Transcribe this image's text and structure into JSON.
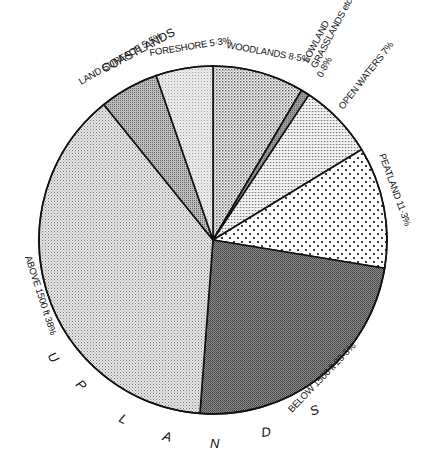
{
  "chart_data": {
    "type": "pie",
    "title": "",
    "start_angle_deg": 0,
    "direction": "clockwise",
    "slices": [
      {
        "label": "WOODLANDS",
        "value": 8.5,
        "display": "WOODLANDS 8·5%",
        "pattern": "crosshatch-medium"
      },
      {
        "label": "LOWLAND GRASSLANDS etc",
        "value": 0.8,
        "display": "0·8%",
        "pattern": "dark-grey"
      },
      {
        "label": "OPEN WATERS",
        "value": 7,
        "display": "OPEN WATERS 7%",
        "pattern": "fine-grid"
      },
      {
        "label": "PEATLAND",
        "value": 11.3,
        "display": "PEATLAND 11·3%",
        "pattern": "sparse-dots"
      },
      {
        "label": "BELOW 1500 ft",
        "value": 23.6,
        "display": "BELOW 1500 ft 23·6%",
        "pattern": "dense-dark",
        "group": "UPLANDS"
      },
      {
        "label": "ABOVE 1500 ft",
        "value": 38,
        "display": "ABOVE 1500 ft 38%",
        "pattern": "light-stipple",
        "group": "UPLANDS"
      },
      {
        "label": "LAND SURFACE",
        "value": 5.5,
        "display": "LAND SURFACE 5·5%",
        "pattern": "medium-grey",
        "group": "COASTLANDS"
      },
      {
        "label": "FORESHORE",
        "value": 5.3,
        "display": "FORESHORE 5·3%",
        "pattern": "light-stipple",
        "group": "COASTLANDS"
      }
    ],
    "groups": [
      {
        "name": "COASTLANDS",
        "members": [
          "LAND SURFACE",
          "FORESHORE"
        ]
      },
      {
        "name": "UPLANDS",
        "members": [
          "BELOW 1500 ft",
          "ABOVE 1500 ft"
        ]
      }
    ],
    "legend": "none (labels placed around circumference)"
  },
  "labels": {
    "coastlands": "COASTLANDS",
    "land_surface": "LAND SURFACE 5·5%",
    "foreshore": "FORESHORE 5·3%",
    "woodlands": "WOODLANDS 8·5%",
    "lowland_1": "LOWLAND",
    "lowland_2": "GRASSLANDS etc",
    "lowland_3": "0·8%",
    "open_waters": "OPEN WATERS 7%",
    "peatland": "PEATLAND 11·3%",
    "below": "BELOW 1500 ft  23·6%",
    "above": "ABOVE 1500 ft  38%",
    "uplands_letters": [
      "U",
      "P",
      "L",
      "A",
      "N",
      "D",
      "S"
    ]
  }
}
